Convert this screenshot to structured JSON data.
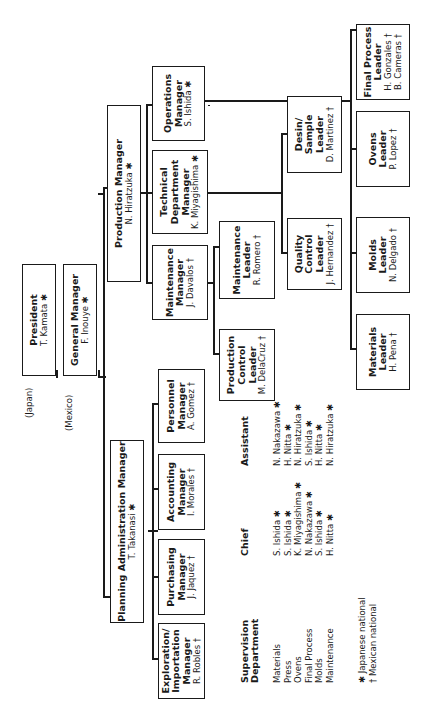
{
  "chart": {
    "orientation": "rotated 90 degrees counter-clockwise",
    "nodes": {
      "president": {
        "title": "President",
        "name": "T. Kamata ✱"
      },
      "general_manager": {
        "title": "General Manager",
        "name": "F. Inouye ✱"
      },
      "planning_admin": {
        "title": "Planning Administration Manager",
        "name": "T. Takanasi ✱"
      },
      "production": {
        "title": "Production Manager",
        "name": "N. Hiratzuka ✱"
      },
      "exploration": {
        "title": "Exploration/\nImportation\nManager",
        "name": "R. Robles †"
      },
      "purchasing": {
        "title": "Purchasing\nManager",
        "name": "J. Jaquez †"
      },
      "accounting": {
        "title": "Accounting\nManager",
        "name": "I. Morales †"
      },
      "personnel": {
        "title": "Personnel\nManager",
        "name": "A. Gomez †"
      },
      "maintenance_mgr": {
        "title": "Maintenance\nManager",
        "name": "J. Davalos †"
      },
      "technical": {
        "title": "Technical\nDepartment\nManager",
        "name": "K. Miyagishima ✱"
      },
      "operations": {
        "title": "Operations\nManager",
        "name": "S. Ishida ✱"
      },
      "production_control": {
        "title": "Production\nControl\nLeader",
        "name": "M. DelaCruz †"
      },
      "maintenance_leader": {
        "title": "Maintenance\nLeader",
        "name": "R. Romero †"
      },
      "quality": {
        "title": "Quality\nControl\nLeader",
        "name": "J. Hernandez †"
      },
      "design": {
        "title": "Desin/\nSample\nLeader",
        "name": "D. Martinez †"
      },
      "materials": {
        "title": "Materials\nLeader",
        "name": "H. Pena †"
      },
      "molds": {
        "title": "Molds\nLeader",
        "name": "N. Delgado †"
      },
      "ovens": {
        "title": "Ovens\nLeader",
        "name": "P. Lopez †"
      },
      "final_process": {
        "title": "Final Process\nLeader",
        "name": "H. Gonzales †\nB. Cameras †"
      }
    },
    "location_labels": {
      "japan": "(Japan)",
      "mexico": "(Mexico)"
    }
  },
  "supervision": {
    "headers": {
      "department": "Supervision\nDepartment",
      "chief": "Chief",
      "assistant": "Assistant"
    },
    "rows": [
      {
        "department": "Materials",
        "chief": "S. Ishida ✱",
        "assistant": "N. Nakazawa ✱"
      },
      {
        "department": "Press",
        "chief": "S. Ishida ✱",
        "assistant": "H. Nitta ✱"
      },
      {
        "department": "Ovens",
        "chief": "K. Miyagishima ✱",
        "assistant": "N. Hiratzuka ✱"
      },
      {
        "department": "Final Process",
        "chief": "N. Nakazawa ✱",
        "assistant": "S. Ishida ✱"
      },
      {
        "department": "Molds",
        "chief": "S. Ishida ✱",
        "assistant": "H. Nitta ✱"
      },
      {
        "department": "Maintenance",
        "chief": "H. Nitta ✱",
        "assistant": "N. Hiratzuka ✱"
      }
    ]
  },
  "legend": {
    "japanese": "✱  Japanese national",
    "mexican": "†  Mexican national"
  }
}
